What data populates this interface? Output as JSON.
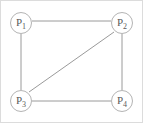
{
  "figure": {
    "kind": "undirected-graph-diagram",
    "background_color": "#ffffff",
    "edge_color": "#9a9a9a",
    "node_outline_color": "#b4b4b4",
    "node_fill_color": "#ffffff",
    "label_color": "#5a5a5a",
    "frame_color": "#d8d8d8"
  },
  "nodes": [
    {
      "id": "P1",
      "base": "P",
      "subscript": "1",
      "label": "P1",
      "cx": 21,
      "cy": 23,
      "r": 11
    },
    {
      "id": "P2",
      "base": "P",
      "subscript": "2",
      "label": "P2",
      "cx": 122,
      "cy": 23,
      "r": 11
    },
    {
      "id": "P3",
      "base": "P",
      "subscript": "3",
      "label": "P3",
      "cx": 21,
      "cy": 101,
      "r": 11
    },
    {
      "id": "P4",
      "base": "P",
      "subscript": "4",
      "label": "P4",
      "cx": 122,
      "cy": 101,
      "r": 11
    }
  ],
  "edges": [
    {
      "id": "e-p1-p2",
      "from": "P1",
      "to": "P2",
      "kind": "top-horizontal"
    },
    {
      "id": "e-p1-p3",
      "from": "P1",
      "to": "P3",
      "kind": "left-vertical"
    },
    {
      "id": "e-p2-p4",
      "from": "P2",
      "to": "P4",
      "kind": "right-vertical"
    },
    {
      "id": "e-p3-p4",
      "from": "P3",
      "to": "P4",
      "kind": "bottom-horizontal"
    },
    {
      "id": "e-p2-p3",
      "from": "P2",
      "to": "P3",
      "kind": "diagonal"
    }
  ]
}
